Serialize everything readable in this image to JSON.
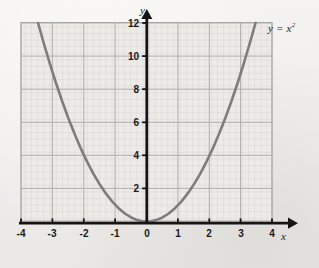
{
  "chart_data": {
    "type": "line",
    "title": "",
    "subtitle": "",
    "xlabel": "x",
    "ylabel": "y",
    "xlim": [
      -4,
      4
    ],
    "ylim": [
      0,
      12
    ],
    "grid": true,
    "minor_grid": true,
    "minor_grid_step_x": 0.2,
    "minor_grid_step_y": 0.4,
    "major_grid_step_x": 1,
    "major_grid_step_y": 2,
    "legend_position": "top-right",
    "annotations": [
      {
        "name": "equation-label",
        "text": "y = x",
        "superscript": "2",
        "x": 3.95,
        "y": 11.9
      }
    ],
    "xticks": [
      -4,
      -3,
      -2,
      -1,
      0,
      1,
      2,
      3,
      4
    ],
    "xtick_labels": [
      "-4",
      "-3",
      "-2",
      "-1",
      "0",
      "1",
      "2",
      "3",
      "4"
    ],
    "yticks": [
      2,
      4,
      6,
      8,
      10,
      12
    ],
    "ytick_labels": [
      "2",
      "4",
      "6",
      "8",
      "10",
      "12"
    ],
    "series": [
      {
        "name": "y = x^2",
        "color": "#7d7d7d",
        "linewidth": 2.6,
        "x": [
          -3.465,
          -3.3,
          -3.1,
          -2.9,
          -2.7,
          -2.5,
          -2.3,
          -2.1,
          -1.9,
          -1.7,
          -1.5,
          -1.3,
          -1.1,
          -0.9,
          -0.7,
          -0.5,
          -0.3,
          -0.1,
          0,
          0.1,
          0.3,
          0.5,
          0.7,
          0.9,
          1.1,
          1.3,
          1.5,
          1.7,
          1.9,
          2.1,
          2.3,
          2.5,
          2.7,
          2.9,
          3.1,
          3.3,
          3.465
        ],
        "values": [
          12.006,
          10.89,
          9.61,
          8.41,
          7.29,
          6.25,
          5.29,
          4.41,
          3.61,
          2.89,
          2.25,
          1.69,
          1.21,
          0.81,
          0.49,
          0.25,
          0.09,
          0.01,
          0,
          0.01,
          0.09,
          0.25,
          0.49,
          0.81,
          1.21,
          1.69,
          2.25,
          2.89,
          3.61,
          4.41,
          5.29,
          6.25,
          7.29,
          8.41,
          9.61,
          10.89,
          12.006
        ]
      }
    ]
  },
  "axes": {
    "y_axis_name": "y",
    "x_axis_name": "x"
  },
  "colors": {
    "background": "#f2f1ef",
    "curve": "#7d7d7d",
    "axis": "#111111",
    "major_grid": "#a8a7a5",
    "minor_grid": "#cfcecb",
    "plot_fill": "#eceae6",
    "tick_text": "#1a1a1a"
  }
}
